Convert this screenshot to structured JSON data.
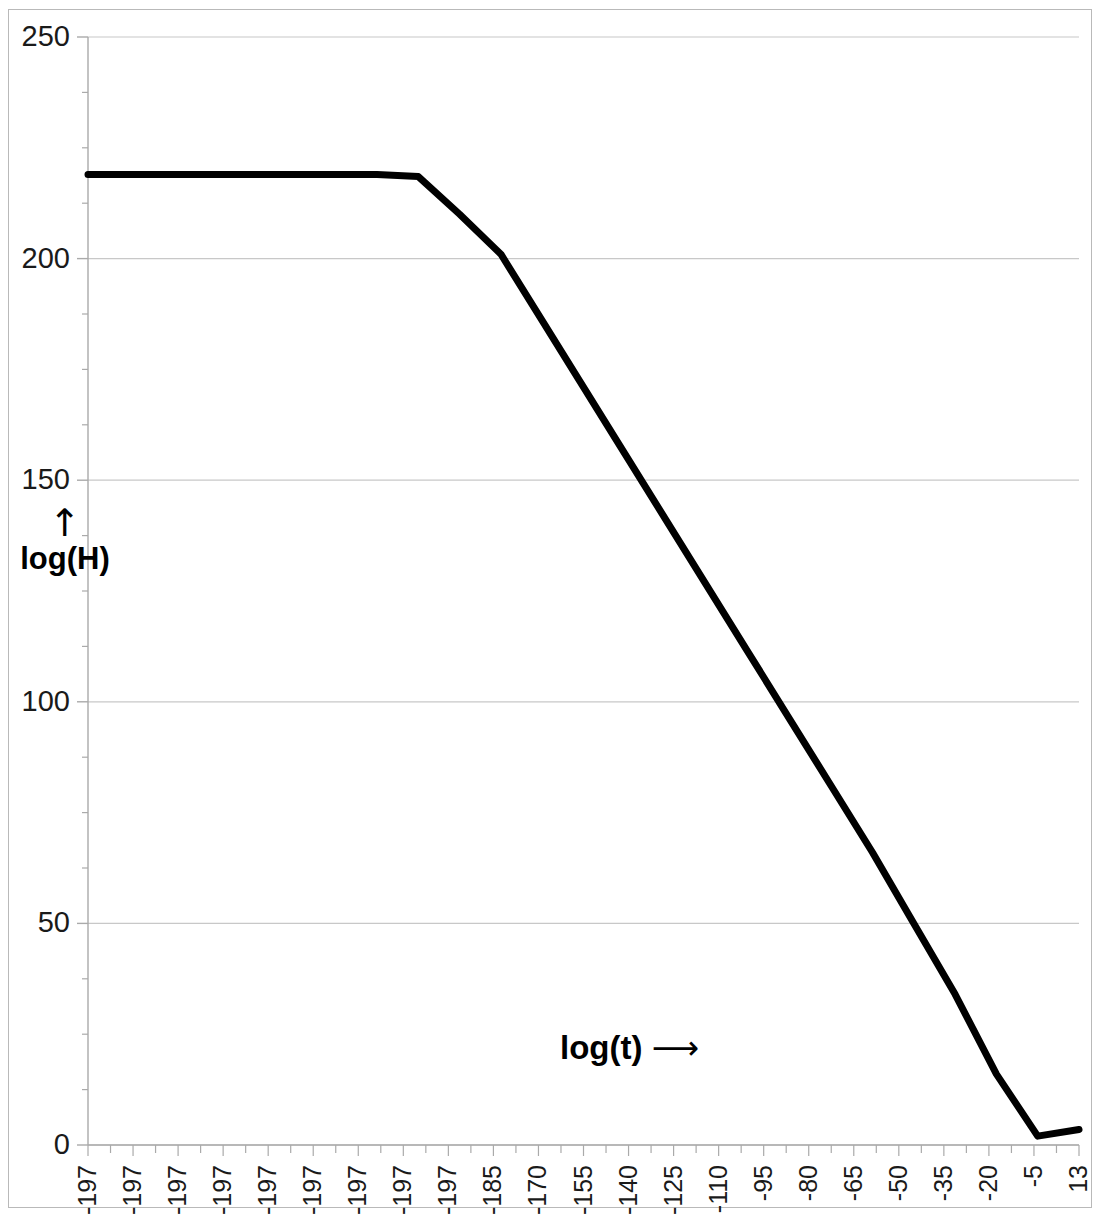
{
  "chart_data": {
    "type": "line",
    "title": "",
    "xlabel": "log(t)",
    "ylabel": "log(H)",
    "xlabel_arrow": "⟶",
    "ylabel_arrow": "↑",
    "ylim": [
      0,
      250
    ],
    "yticks": [
      0,
      50,
      100,
      150,
      200,
      250
    ],
    "ytick_labels": [
      "0",
      "50",
      "100",
      "150",
      "200",
      "250"
    ],
    "grid": true,
    "grid_axis": "y",
    "legend": null,
    "line_color": "#000000",
    "line_width": 7,
    "grid_color": "#c8c8c8",
    "axis_color": "#aaaaaa",
    "xtick_labels": [
      "-197",
      "-197",
      "-197",
      "-197",
      "-197",
      "-197",
      "-197",
      "-197",
      "-197",
      "-185",
      "-170",
      "-155",
      "-140",
      "-125",
      "-110",
      "-95",
      "-80",
      "-65",
      "-50",
      "-35",
      "-20",
      "-5",
      "13"
    ],
    "xtick_label_stride": 2,
    "minor_tick_count": 48,
    "series": [
      {
        "name": "log(H)",
        "x": [
          0,
          1,
          2,
          3,
          4,
          5,
          6,
          7,
          8,
          9,
          10,
          11,
          12,
          13,
          14,
          15,
          16,
          17,
          18,
          19,
          20,
          21,
          22,
          23,
          24
        ],
        "values": [
          219,
          219,
          219,
          219,
          219,
          219,
          219,
          219,
          218.5,
          210,
          201,
          186,
          171,
          156,
          141,
          126,
          111,
          96,
          81,
          66,
          50,
          34,
          16,
          2,
          3.5
        ]
      }
    ],
    "annotations": [
      {
        "text": "plateau at log(H) ≈ 219 until log(t) ≈ -195"
      },
      {
        "text": "linear decline from ≈ 219 to ≈ 2"
      },
      {
        "text": "flattens near zero at right edge with slight uptick"
      }
    ]
  }
}
